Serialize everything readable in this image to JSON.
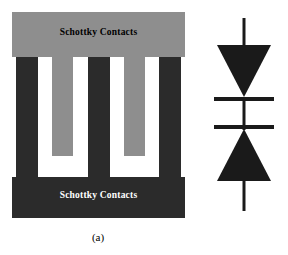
{
  "figure": {
    "panel_a": {
      "caption": "(a)",
      "top_contact_label": "Schottky Contacts",
      "bottom_contact_label": "Schottky Contacts",
      "colors": {
        "top_pad": "#8e8e8e",
        "bottom_pad": "#2b2b2b",
        "gap": "#ffffff",
        "top_text": "#000000",
        "bottom_text": "#ffffff"
      },
      "fingers": [
        {
          "id": "finger-1",
          "type": "dark",
          "left": 4,
          "width": 22,
          "color": "#2b2b2b"
        },
        {
          "id": "finger-2",
          "type": "gray",
          "left": 40,
          "width": 21,
          "color": "#8e8e8e"
        },
        {
          "id": "finger-3",
          "type": "dark",
          "left": 76,
          "width": 22,
          "color": "#2b2b2b"
        },
        {
          "id": "finger-4",
          "type": "gray",
          "left": 112,
          "width": 21,
          "color": "#8e8e8e"
        },
        {
          "id": "finger-5",
          "type": "dark",
          "left": 147,
          "width": 22,
          "color": "#2b2b2b"
        }
      ]
    },
    "panel_b": {
      "caption": "(b)",
      "symbol": "back-to-back-schottky-diode-pair",
      "color": "#1a1a1a",
      "elements": [
        {
          "name": "top-lead",
          "type": "line",
          "x1": 44,
          "y1": 18,
          "x2": 44,
          "y2": 45
        },
        {
          "name": "top-diode-triangle",
          "type": "triangle",
          "points": "17,45 71,45 44,97",
          "direction": "down"
        },
        {
          "name": "top-cathode-bar",
          "type": "line",
          "x1": 14,
          "y1": 99,
          "x2": 74,
          "y2": 99
        },
        {
          "name": "middle-lead",
          "type": "line",
          "x1": 44,
          "y1": 99,
          "x2": 44,
          "y2": 128
        },
        {
          "name": "bottom-cathode-bar",
          "type": "line",
          "x1": 14,
          "y1": 127,
          "x2": 74,
          "y2": 127
        },
        {
          "name": "bottom-diode-triangle",
          "type": "triangle",
          "points": "17,181 71,181 44,129",
          "direction": "up"
        },
        {
          "name": "bottom-lead",
          "type": "line",
          "x1": 44,
          "y1": 181,
          "x2": 44,
          "y2": 211
        }
      ]
    }
  }
}
